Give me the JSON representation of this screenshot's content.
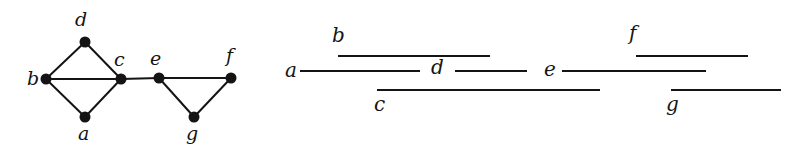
{
  "figure": {
    "background_color": "#ffffff",
    "ink_color": "#141414",
    "vertex_radius": 5.5,
    "edge_width": 2.0,
    "interval_width": 2.0
  },
  "graph": {
    "name": "interval-graph",
    "vertices": [
      {
        "id": "b",
        "label": "b",
        "x": 46,
        "y": 79,
        "label_x": 27,
        "label_y": 69
      },
      {
        "id": "d",
        "label": "d",
        "x": 85,
        "y": 42,
        "label_x": 75,
        "label_y": 10
      },
      {
        "id": "c",
        "label": "c",
        "x": 121,
        "y": 79,
        "label_x": 114,
        "label_y": 50
      },
      {
        "id": "a",
        "label": "a",
        "x": 85,
        "y": 117,
        "label_x": 78,
        "label_y": 124
      },
      {
        "id": "e",
        "label": "e",
        "x": 159,
        "y": 78,
        "label_x": 150,
        "label_y": 49
      },
      {
        "id": "f",
        "label": "f",
        "x": 231,
        "y": 78,
        "label_x": 226,
        "label_y": 46
      },
      {
        "id": "g",
        "label": "g",
        "x": 194,
        "y": 117,
        "label_x": 186,
        "label_y": 124
      }
    ],
    "edges": [
      {
        "from": "b",
        "to": "d"
      },
      {
        "from": "b",
        "to": "c"
      },
      {
        "from": "b",
        "to": "a"
      },
      {
        "from": "d",
        "to": "c"
      },
      {
        "from": "a",
        "to": "c"
      },
      {
        "from": "c",
        "to": "e"
      },
      {
        "from": "e",
        "to": "f"
      },
      {
        "from": "e",
        "to": "g"
      },
      {
        "from": "g",
        "to": "f"
      }
    ]
  },
  "intervals": {
    "name": "interval-representation",
    "rows": [
      {
        "id": "b",
        "label": "b",
        "y": 56,
        "x1": 58,
        "x2": 210,
        "label_x": 52,
        "label_y": 26,
        "label_align": "left"
      },
      {
        "id": "f",
        "label": "f",
        "y": 56,
        "x1": 356,
        "x2": 468,
        "label_x": 349,
        "label_y": 24,
        "label_align": "left"
      },
      {
        "id": "a",
        "label": "a",
        "y": 71,
        "x1": 20,
        "x2": 140,
        "label_x": 5,
        "label_y": 61,
        "label_align": "left"
      },
      {
        "id": "d",
        "label": "d",
        "y": 71,
        "x1": 175,
        "x2": 247,
        "label_x": 151,
        "label_y": 58,
        "label_align": "left"
      },
      {
        "id": "e",
        "label": "e",
        "y": 71,
        "x1": 282,
        "x2": 426,
        "label_x": 264,
        "label_y": 60,
        "label_align": "left"
      },
      {
        "id": "c",
        "label": "c",
        "y": 90,
        "x1": 97,
        "x2": 320,
        "label_x": 94,
        "label_y": 95,
        "label_align": "left"
      },
      {
        "id": "g",
        "label": "g",
        "y": 90,
        "x1": 391,
        "x2": 501,
        "label_x": 386,
        "label_y": 95,
        "label_align": "left"
      }
    ]
  }
}
